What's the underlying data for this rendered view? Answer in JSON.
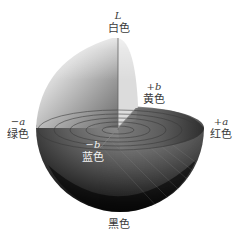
{
  "diagram": {
    "axes": {
      "L": {
        "symbol": "L",
        "color_name": "白色"
      },
      "plus_b": {
        "symbol": "+b",
        "color_name": "黄色"
      },
      "minus_a": {
        "symbol": "−a",
        "color_name": "绿色"
      },
      "plus_a": {
        "symbol": "+a",
        "color_name": "红色"
      },
      "minus_b": {
        "symbol": "−b",
        "color_name": "蓝色"
      },
      "bottom": {
        "color_name": "黑色"
      }
    },
    "colors": {
      "background": "#ffffff",
      "label_text": "#3a3a3a",
      "label_text_inverse": "#f2f2f2",
      "solid_dark": "#0d0d0d",
      "solid_mid": "#5a5a5a",
      "solid_light": "#e6e6e6"
    }
  }
}
